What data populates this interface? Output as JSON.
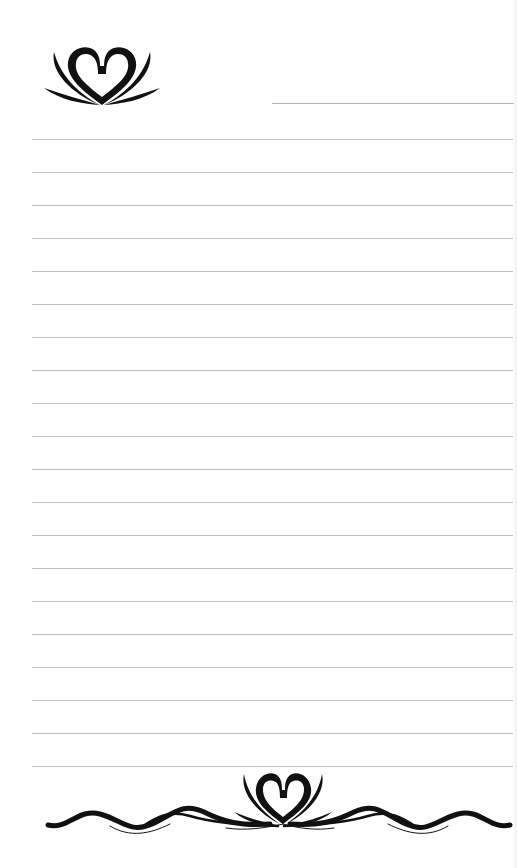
{
  "page": {
    "type": "lined-notepaper",
    "background_color": "#fefefe",
    "line_color": "#bdbdbd",
    "ornament_color": "#111111",
    "line_count": 20,
    "first_line_y": 139,
    "line_spacing": 33,
    "line_left": 32,
    "line_right": 513
  },
  "header": {
    "ornament_icon": "heart-lotus-icon",
    "name_line": "blank"
  },
  "footer": {
    "ornament_icon": "heart-lotus-swirl-border-icon"
  }
}
